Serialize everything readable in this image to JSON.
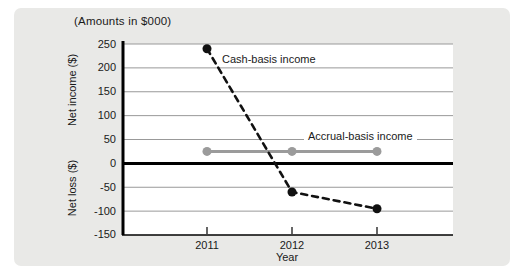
{
  "chart_data": {
    "type": "line",
    "title": "(Amounts in $000)",
    "xlabel": "Year",
    "ylabel_positive": "Net income ($)",
    "ylabel_negative": "Net loss ($)",
    "categories": [
      "2011",
      "2012",
      "2013"
    ],
    "yticks": [
      250,
      200,
      150,
      100,
      50,
      0,
      -50,
      -100,
      -150
    ],
    "ylim": [
      -150,
      250
    ],
    "grid": true,
    "legend_position": "inline-annotations",
    "series": [
      {
        "name": "Cash-basis income",
        "values": [
          240,
          -60,
          -95
        ],
        "color": "#111111",
        "line_style": "dashed",
        "marker": "circle"
      },
      {
        "name": "Accrual-basis income",
        "values": [
          25,
          25,
          25
        ],
        "color": "#9b9b9b",
        "line_style": "solid",
        "marker": "circle"
      }
    ],
    "colors": {
      "grid": "#999999",
      "zero_line": "#000000",
      "axis": "#000000",
      "panel_bg": "#e9e9e7",
      "plot_bg": "#ffffff"
    }
  }
}
